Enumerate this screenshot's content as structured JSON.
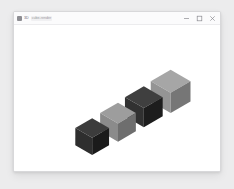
{
  "window": {
    "titlebar": {
      "favicon_name": "app-favicon",
      "title": "3D",
      "subtitle": "cube-render",
      "controls": [
        {
          "name": "minimize-button",
          "glyph": "minimize"
        },
        {
          "name": "maximize-button",
          "glyph": "maximize"
        },
        {
          "name": "close-button",
          "glyph": "close"
        }
      ]
    }
  },
  "scene": {
    "label": "isometric-cube-row",
    "background": "#ffffff",
    "cubes": [
      {
        "index": 1,
        "name": "cube-1",
        "tone": "dark",
        "top_color": "#3c3c3c",
        "left_color": "#2e2e2e",
        "right_color": "#1b1b1b",
        "cx": 78,
        "cy": 121,
        "size": 17
      },
      {
        "index": 2,
        "name": "cube-2",
        "tone": "light",
        "top_color": "#9d9d9d",
        "left_color": "#8b8b8b",
        "right_color": "#6e6e6e",
        "cx": 104,
        "cy": 107,
        "size": 18
      },
      {
        "index": 3,
        "name": "cube-3",
        "tone": "dark",
        "top_color": "#3f3f3f",
        "left_color": "#313131",
        "right_color": "#1d1d1d",
        "cx": 130,
        "cy": 92,
        "size": 19
      },
      {
        "index": 4,
        "name": "cube-4",
        "tone": "medium",
        "top_color": "#a6a6a6",
        "left_color": "#949494",
        "right_color": "#767676",
        "cx": 157,
        "cy": 77,
        "size": 20
      }
    ]
  }
}
